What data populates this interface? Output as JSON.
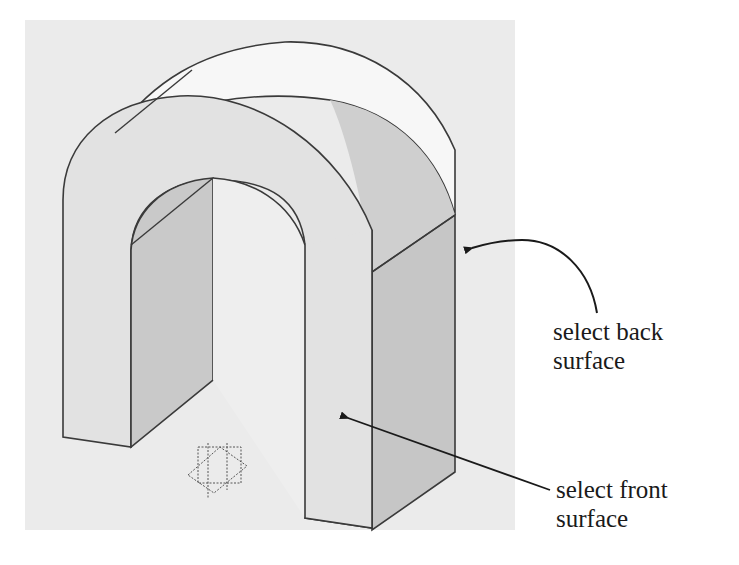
{
  "figure": {
    "type": "cad-isometric-part",
    "part": "U-shaped arch extrusion",
    "colors": {
      "viewport_background": "#ebebeb",
      "front_face": "#e2e2e2",
      "top_face": "#f7f7f7",
      "side_face": "#c9c9c9",
      "inner_face": "#cfcfcf",
      "edge": "#3a3a3a",
      "text": "#1a1a1a"
    }
  },
  "annotations": [
    {
      "id": "back",
      "line1": "select back",
      "line2": "surface",
      "icon": "curved-arrow-icon"
    },
    {
      "id": "front",
      "line1": "select front",
      "line2": "surface",
      "icon": "straight-arrow-icon"
    }
  ],
  "triad": {
    "icon": "coordinate-triad-icon"
  }
}
